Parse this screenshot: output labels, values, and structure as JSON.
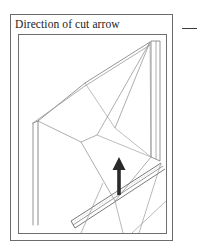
{
  "figure": {
    "caption": "Direction of cut arrow",
    "side_marker": "dash-mark",
    "colors": {
      "frame_stroke": "#6b6b6b",
      "line_light": "#9a9a9a",
      "line_mid": "#7a7a7a",
      "line_dark": "#4a4a4a",
      "arrow_fill": "#2a2a2a",
      "background": "#ffffff"
    },
    "drawing": {
      "type": "technical-line-drawing",
      "subject": "perspective wireframe of a cut plane with direction-of-cut arrow",
      "viewport": {
        "width": 147,
        "height": 198
      },
      "annotation": {
        "arrow": {
          "label": "direction-of-cut-arrow",
          "points_to": "up",
          "tip": {
            "x": 100,
            "y": 122
          },
          "tail": {
            "x": 100,
            "y": 160
          },
          "shaft_width": 4,
          "head_width": 13,
          "head_height": 13
        }
      },
      "geometry": {
        "outer_edges": [
          {
            "name": "left-post-outer",
            "x1": 14,
            "y1": 88,
            "x2": 14,
            "y2": 190
          },
          {
            "name": "left-post-inner",
            "x1": 19,
            "y1": 86,
            "x2": 19,
            "y2": 190
          },
          {
            "name": "left-post-cap",
            "x1": 14,
            "y1": 88,
            "x2": 19,
            "y2": 86
          },
          {
            "name": "top-ridge-left",
            "x1": 19,
            "y1": 86,
            "x2": 66,
            "y2": 48
          },
          {
            "name": "top-ridge-right",
            "x1": 66,
            "y1": 48,
            "x2": 131,
            "y2": 7
          },
          {
            "name": "top-ridge-left-lower",
            "x1": 14,
            "y1": 88,
            "x2": 66,
            "y2": 51
          },
          {
            "name": "top-ridge-right-lower",
            "x1": 66,
            "y1": 51,
            "x2": 131,
            "y2": 10
          }
        ],
        "right_column": [
          {
            "name": "col-left-edge",
            "x1": 132,
            "y1": 6,
            "x2": 132,
            "y2": 122
          },
          {
            "name": "col-mid-edge",
            "x1": 137,
            "y1": 6,
            "x2": 137,
            "y2": 124
          },
          {
            "name": "col-right-edge",
            "x1": 141,
            "y1": 6,
            "x2": 141,
            "y2": 126
          },
          {
            "name": "col-base-left",
            "x1": 132,
            "y1": 122,
            "x2": 141,
            "y2": 126
          }
        ],
        "facet_lines": [
          {
            "name": "facet-a",
            "x1": 66,
            "y1": 48,
            "x2": 96,
            "y2": 93
          },
          {
            "name": "facet-b",
            "x1": 131,
            "y1": 7,
            "x2": 96,
            "y2": 93
          },
          {
            "name": "facet-c",
            "x1": 131,
            "y1": 7,
            "x2": 78,
            "y2": 100
          },
          {
            "name": "facet-d",
            "x1": 131,
            "y1": 7,
            "x2": 132,
            "y2": 122
          },
          {
            "name": "facet-e",
            "x1": 96,
            "y1": 93,
            "x2": 132,
            "y2": 122
          },
          {
            "name": "facet-f",
            "x1": 78,
            "y1": 100,
            "x2": 132,
            "y2": 122
          },
          {
            "name": "facet-g",
            "x1": 19,
            "y1": 86,
            "x2": 62,
            "y2": 107
          },
          {
            "name": "facet-h",
            "x1": 62,
            "y1": 107,
            "x2": 78,
            "y2": 100
          },
          {
            "name": "facet-i",
            "x1": 62,
            "y1": 107,
            "x2": 96,
            "y2": 166
          },
          {
            "name": "facet-j",
            "x1": 96,
            "y1": 166,
            "x2": 132,
            "y2": 122
          }
        ],
        "bottom_beam": [
          {
            "name": "beam-top",
            "x1": 52,
            "y1": 186,
            "x2": 142,
            "y2": 128
          },
          {
            "name": "beam-mid",
            "x1": 54,
            "y1": 190,
            "x2": 144,
            "y2": 131
          },
          {
            "name": "beam-bottom",
            "x1": 56,
            "y1": 193,
            "x2": 146,
            "y2": 134
          },
          {
            "name": "beam-cap",
            "x1": 52,
            "y1": 186,
            "x2": 56,
            "y2": 193
          }
        ],
        "lower_lines": [
          {
            "name": "lower-a",
            "x1": 96,
            "y1": 166,
            "x2": 104,
            "y2": 198
          },
          {
            "name": "lower-b",
            "x1": 142,
            "y1": 128,
            "x2": 120,
            "y2": 198
          },
          {
            "name": "lower-c",
            "x1": 84,
            "y1": 148,
            "x2": 62,
            "y2": 198
          },
          {
            "name": "lower-d",
            "x1": 113,
            "y1": 198,
            "x2": 147,
            "y2": 166
          }
        ]
      }
    }
  }
}
